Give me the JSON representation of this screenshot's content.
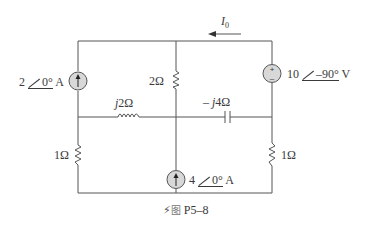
{
  "figure": {
    "caption_icon": "lightning-icon",
    "caption_prefix": "图",
    "caption_label": "P5–8"
  },
  "current_label": {
    "symbol": "I",
    "subscript": "0"
  },
  "components": {
    "current_source_left": {
      "mag": "2",
      "angle": "0°",
      "unit": "A"
    },
    "resistor_top_middle": {
      "value": "2Ω"
    },
    "voltage_source_right": {
      "mag": "10",
      "angle": "–90°",
      "unit": "V"
    },
    "inductor": {
      "prefix": "j",
      "value": "2Ω"
    },
    "capacitor": {
      "prefix": "– j",
      "value": "4Ω"
    },
    "resistor_bottom_left": {
      "value": "1Ω"
    },
    "current_source_middle": {
      "mag": "4",
      "angle": "0°",
      "unit": "A"
    },
    "resistor_bottom_right": {
      "value": "1Ω"
    }
  },
  "colors": {
    "wire": "#555555",
    "source_fill": "#d8d8d8"
  }
}
